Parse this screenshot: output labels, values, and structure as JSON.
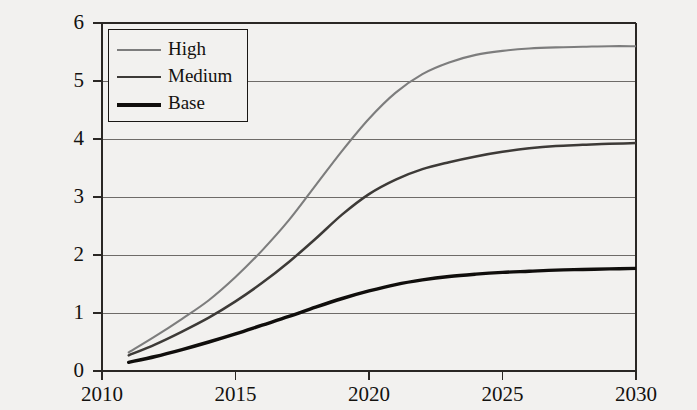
{
  "chart_data": {
    "type": "line",
    "title": "",
    "xlabel": "",
    "ylabel": "Million MT CO2e",
    "ylabel_parts": {
      "prefix": "Million MT CO",
      "sub": "2",
      "suffix": "e"
    },
    "xlim": [
      2010,
      2030
    ],
    "ylim": [
      0,
      6
    ],
    "xticks": [
      2010,
      2015,
      2020,
      2025,
      2030
    ],
    "xtick_labels": [
      "2010",
      "2015",
      "2020",
      "2025",
      "2030"
    ],
    "yticks": [
      0,
      1,
      2,
      3,
      4,
      5,
      6
    ],
    "ytick_labels": [
      "0",
      "1",
      "2",
      "3",
      "4",
      "5",
      "6"
    ],
    "grid": "horizontal",
    "legend_position": "upper-left",
    "x": [
      2011,
      2012,
      2013,
      2014,
      2015,
      2016,
      2017,
      2018,
      2019,
      2020,
      2021,
      2022,
      2023,
      2024,
      2025,
      2026,
      2027,
      2028,
      2029,
      2030
    ],
    "series": [
      {
        "name": "High",
        "color": "#7d7d7d",
        "width": 2.1,
        "values": [
          0.32,
          0.6,
          0.9,
          1.22,
          1.62,
          2.08,
          2.6,
          3.2,
          3.8,
          4.35,
          4.8,
          5.12,
          5.32,
          5.45,
          5.52,
          5.56,
          5.58,
          5.59,
          5.6,
          5.6
        ]
      },
      {
        "name": "Medium",
        "color": "#3d3a37",
        "width": 2.5,
        "values": [
          0.27,
          0.46,
          0.68,
          0.92,
          1.2,
          1.52,
          1.88,
          2.28,
          2.7,
          3.05,
          3.3,
          3.48,
          3.6,
          3.7,
          3.78,
          3.84,
          3.88,
          3.9,
          3.92,
          3.93
        ]
      },
      {
        "name": "Base",
        "color": "#100e0c",
        "width": 3.4,
        "values": [
          0.15,
          0.25,
          0.37,
          0.5,
          0.64,
          0.79,
          0.94,
          1.1,
          1.25,
          1.38,
          1.49,
          1.57,
          1.63,
          1.67,
          1.7,
          1.72,
          1.74,
          1.75,
          1.76,
          1.77
        ]
      }
    ],
    "legend": [
      {
        "label": "High",
        "color": "#7d7d7d",
        "width": 2.1
      },
      {
        "label": "Medium",
        "color": "#3d3a37",
        "width": 2.8
      },
      {
        "label": "Base",
        "color": "#100e0c",
        "width": 4.0
      }
    ],
    "axis_color": "#2a2724",
    "grid_color": "#6e6b68",
    "background": "#f2f1ef"
  },
  "plot_geometry": {
    "left": 102,
    "right": 636,
    "top": 23,
    "bottom": 371
  }
}
